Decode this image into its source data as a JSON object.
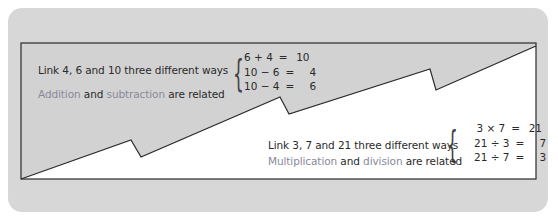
{
  "colors": {
    "card_background": "#d7d7d7",
    "inner_background": "#d2d2d2",
    "white_region": "#ffffff",
    "outline": "#2a2a2a",
    "text": "#2a2a2a",
    "accent_text": "#8a8a9a"
  },
  "upper_panel": {
    "prompt": "Link 4, 6 and 10 three different ways",
    "equations": [
      {
        "lhs": "6 + 4",
        "eq": "=",
        "rhs": "10"
      },
      {
        "lhs": "10 − 6",
        "eq": "=",
        "rhs": "4"
      },
      {
        "lhs": "10 − 4",
        "eq": "=",
        "rhs": "6"
      }
    ],
    "relation": {
      "term1": "Addition",
      "and": "and",
      "term2": "subtraction",
      "rest": "are related"
    }
  },
  "lower_panel": {
    "prompt": "Link 3, 7 and 21 three different ways",
    "equations": [
      {
        "lhs": "3 × 7",
        "eq": "=",
        "rhs": "21"
      },
      {
        "lhs": "21 ÷ 3",
        "eq": "=",
        "rhs": "7"
      },
      {
        "lhs": "21 ÷ 7",
        "eq": "=",
        "rhs": "3"
      }
    ],
    "relation": {
      "term1": "Multiplication",
      "and": "and",
      "term2": "division",
      "rest": "are related"
    }
  },
  "brace": "{"
}
